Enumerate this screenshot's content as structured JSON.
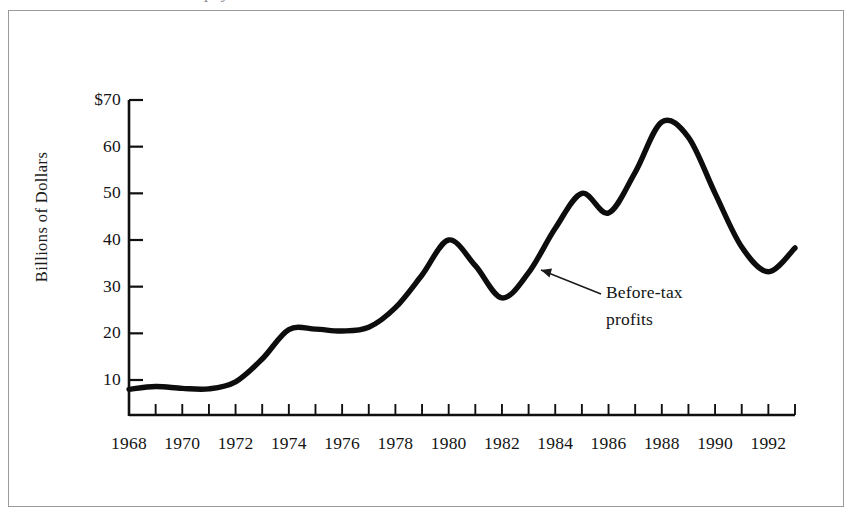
{
  "figure": {
    "clipped_caption_above": "p         y",
    "annotation": {
      "line1": "Before-tax",
      "line2": "profits"
    },
    "axis_title_y": "Billions of Dollars"
  },
  "chart_data": {
    "type": "line",
    "title": "",
    "subtitle": "",
    "xlabel": "",
    "ylabel": "Billions of Dollars",
    "grid": false,
    "legend_position": "none",
    "annotations": [
      {
        "text": "Before-tax profits",
        "points_to_year": 1983.4,
        "points_to_value": 34
      }
    ],
    "xlim": [
      1968,
      1993
    ],
    "ylim": [
      0,
      70
    ],
    "x_tick_labels": [
      "1968",
      "1970",
      "1972",
      "1974",
      "1976",
      "1978",
      "1980",
      "1982",
      "1984",
      "1986",
      "1988",
      "1990",
      "1992"
    ],
    "x_tick_label_values": [
      1968,
      1970,
      1972,
      1974,
      1976,
      1978,
      1980,
      1982,
      1984,
      1986,
      1988,
      1990,
      1992
    ],
    "x_minor_ticks": [
      1969,
      1970,
      1971,
      1972,
      1973,
      1974,
      1975,
      1976,
      1977,
      1978,
      1979,
      1980,
      1981,
      1982,
      1983,
      1984,
      1985,
      1986,
      1987,
      1988,
      1989,
      1990,
      1991,
      1992,
      1993
    ],
    "y_tick_labels": [
      "$70",
      "60",
      "50",
      "40",
      "30",
      "20",
      "10"
    ],
    "y_tick_values": [
      70,
      60,
      50,
      40,
      30,
      20,
      10
    ],
    "series": [
      {
        "name": "Before-tax profits",
        "color": "#0d0d0d",
        "x": [
          1968,
          1969,
          1970,
          1971,
          1972,
          1973,
          1974,
          1975,
          1976,
          1977,
          1978,
          1979,
          1980,
          1981,
          1982,
          1983,
          1984,
          1985,
          1986,
          1987,
          1988,
          1989,
          1990,
          1991,
          1992,
          1993
        ],
        "values": [
          8,
          8.6,
          8.2,
          8.1,
          9.6,
          14.5,
          20.8,
          20.9,
          20.5,
          21.3,
          25.5,
          32.5,
          40.0,
          34.5,
          27.6,
          33.0,
          42.5,
          50.0,
          45.8,
          54.5,
          65.3,
          62.0,
          50.0,
          38.5,
          33.2,
          38.3
        ]
      }
    ]
  }
}
